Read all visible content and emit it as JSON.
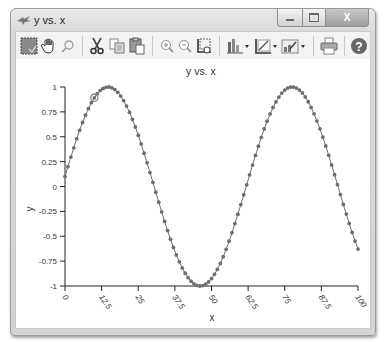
{
  "window": {
    "title": "y vs. x",
    "controls": {
      "minimize": "—",
      "maximize": "▭",
      "close": "X"
    }
  },
  "toolbar": {
    "items": [
      {
        "name": "select-data-icon",
        "label": "Select"
      },
      {
        "name": "pan-hand-icon",
        "label": "Pan"
      },
      {
        "name": "data-cursor-icon",
        "label": "Data cursor"
      },
      {
        "name": "cut-icon",
        "label": "Cut"
      },
      {
        "name": "copy-icon",
        "label": "Copy"
      },
      {
        "name": "paste-icon",
        "label": "Paste"
      },
      {
        "name": "zoom-in-icon",
        "label": "Zoom in"
      },
      {
        "name": "zoom-out-icon",
        "label": "Zoom out"
      },
      {
        "name": "reset-axes-icon",
        "label": "Reset axes"
      },
      {
        "name": "chart-type-icon",
        "label": "Chart type"
      },
      {
        "name": "axes-properties-icon",
        "label": "Axes properties"
      },
      {
        "name": "plot-properties-icon",
        "label": "Plot properties"
      },
      {
        "name": "print-icon",
        "label": "Print"
      },
      {
        "name": "help-icon",
        "label": "Help"
      }
    ]
  },
  "colors": {
    "series": "#6e6e6e",
    "axis": "#222222",
    "highlight_marker": "#8a8a8a"
  },
  "chart_data": {
    "type": "scatter",
    "title": "y vs. x",
    "xlabel": "x",
    "ylabel": "y",
    "xlim": [
      0,
      100
    ],
    "ylim": [
      -1,
      1
    ],
    "xticks": [
      "0",
      "12.5",
      "25",
      "37.5",
      "50",
      "62.5",
      "75",
      "87.5",
      "100"
    ],
    "yticks": [
      "1",
      "0.75",
      "0.5",
      "0.25",
      "0",
      "-0.25",
      "-0.5",
      "-0.75",
      "-1"
    ],
    "grid": false,
    "legend": null,
    "series": [
      {
        "name": "y",
        "marker": "circle",
        "line": true,
        "formula_approx": "y = sin(x/10 + 0.1)",
        "x": [
          0,
          1,
          2,
          3,
          4,
          5,
          6,
          7,
          8,
          9,
          10,
          11,
          12,
          13,
          14,
          15,
          16,
          17,
          18,
          19,
          20,
          21,
          22,
          23,
          24,
          25,
          26,
          27,
          28,
          29,
          30,
          31,
          32,
          33,
          34,
          35,
          36,
          37,
          38,
          39,
          40,
          41,
          42,
          43,
          44,
          45,
          46,
          47,
          48,
          49,
          50,
          51,
          52,
          53,
          54,
          55,
          56,
          57,
          58,
          59,
          60,
          61,
          62,
          63,
          64,
          65,
          66,
          67,
          68,
          69,
          70,
          71,
          72,
          73,
          74,
          75,
          76,
          77,
          78,
          79,
          80,
          81,
          82,
          83,
          84,
          85,
          86,
          87,
          88,
          89,
          90,
          91,
          92,
          93,
          94,
          95,
          96,
          97,
          98,
          99,
          100
        ],
        "values": [
          0.1,
          0.199,
          0.296,
          0.389,
          0.479,
          0.565,
          0.644,
          0.717,
          0.783,
          0.842,
          0.891,
          0.932,
          0.964,
          0.985,
          0.997,
          1.0,
          0.992,
          0.974,
          0.946,
          0.909,
          0.863,
          0.808,
          0.746,
          0.675,
          0.598,
          0.515,
          0.427,
          0.334,
          0.239,
          0.14,
          0.042,
          -0.058,
          -0.158,
          -0.256,
          -0.351,
          -0.443,
          -0.53,
          -0.612,
          -0.688,
          -0.757,
          -0.818,
          -0.872,
          -0.916,
          -0.952,
          -0.978,
          -0.994,
          -1.0,
          -0.996,
          -0.982,
          -0.959,
          -0.926,
          -0.883,
          -0.832,
          -0.773,
          -0.706,
          -0.631,
          -0.55,
          -0.464,
          -0.373,
          -0.279,
          -0.182,
          -0.083,
          0.017,
          0.116,
          0.215,
          0.312,
          0.405,
          0.494,
          0.578,
          0.656,
          0.729,
          0.794,
          0.85,
          0.899,
          0.939,
          0.969,
          0.989,
          0.999,
          0.999,
          0.989,
          0.969,
          0.94,
          0.9,
          0.852,
          0.795,
          0.73,
          0.658,
          0.58,
          0.496,
          0.407,
          0.313,
          0.217,
          0.118,
          0.018,
          -0.081,
          -0.18,
          -0.277,
          -0.371,
          -0.462,
          -0.548,
          -0.629
        ]
      }
    ],
    "annotations": [
      {
        "type": "selected-point-marker",
        "x": 10,
        "y": 0.891
      }
    ]
  }
}
